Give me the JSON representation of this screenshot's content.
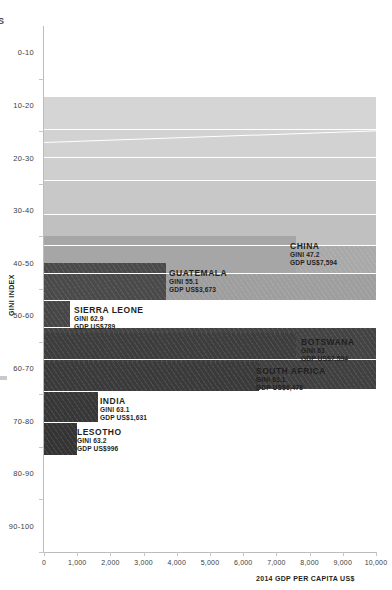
{
  "axes": {
    "y_title": "GINI INDEX",
    "x_title": "2014 GDP PER CAPITA US$",
    "y_ticks": [
      "0-10",
      "10-20",
      "20-30",
      "30-40",
      "40-50",
      "50-60",
      "60-70",
      "70-80",
      "80-90",
      "90-100"
    ],
    "x_ticks": [
      "0",
      "1,000",
      "2,000",
      "3,000",
      "4,000",
      "5,000",
      "6,000",
      "7,000",
      "8,000",
      "9,000",
      "10,000"
    ]
  },
  "corner_glyph": "S",
  "callouts": [
    {
      "name": "CHINA",
      "gini": "GINI 47.2",
      "gdp": "GDP US$7,594"
    },
    {
      "name": "GUATEMALA",
      "gini": "GINI 55.1",
      "gdp": "GDP US$3,673"
    },
    {
      "name": "SIERRA LEONE",
      "gini": "GINI 62.9",
      "gdp": "GDP US$789"
    },
    {
      "name": "BOTSWANA",
      "gini": "GINI 63",
      "gdp": "GDP US$7,594"
    },
    {
      "name": "SOUTH AFRICA",
      "gini": "GINI 63.1",
      "gdp": "GDP US$6,478"
    },
    {
      "name": "INDIA",
      "gini": "GINI 63.1",
      "gdp": "GDP US$1,631"
    },
    {
      "name": "LESOTHO",
      "gini": "GINI 63.2",
      "gdp": "GDP US$996"
    }
  ],
  "chart_data": {
    "type": "bar",
    "orientation": "horizontal",
    "title": "",
    "xlabel": "2014 GDP PER CAPITA US$",
    "ylabel": "GINI INDEX",
    "xlim": [
      0,
      10000
    ],
    "xticks": [
      0,
      1000,
      2000,
      3000,
      4000,
      5000,
      6000,
      7000,
      8000,
      9000,
      10000
    ],
    "y_categories": [
      "0-10",
      "10-20",
      "20-30",
      "30-40",
      "40-50",
      "50-60",
      "60-70",
      "70-80",
      "80-90",
      "90-100"
    ],
    "grid": false,
    "legend": "none",
    "note": "Stacked horizontal band chart: each country is one bar; bar length = 2014 GDP per capita US$, vertical position = Gini index band. Bars above 50 Gini are labelled; the light-gray bars in the 20-50 bands extend beyond the plotted 10,000 range (clipped at right edge).",
    "bars": [
      {
        "label": "",
        "gini": 22.0,
        "gdp": 10000,
        "clipped": true,
        "shade": "#d5d5d5"
      },
      {
        "label": "",
        "gini": 24.5,
        "gdp": 10000,
        "clipped": true,
        "shade": "#d2d2d2"
      },
      {
        "label": "",
        "gini": 27.0,
        "gdp": 10000,
        "clipped": true,
        "shade": "#cfcfcf"
      },
      {
        "label": "",
        "gini": 30.0,
        "gdp": 10000,
        "clipped": true,
        "shade": "#c8c8c8"
      },
      {
        "label": "",
        "gini": 34.0,
        "gdp": 10000,
        "clipped": true,
        "shade": "#c0c0c0"
      },
      {
        "label": "",
        "gini": 38.0,
        "gdp": 10000,
        "clipped": true,
        "shade": "#a9a9a9"
      },
      {
        "label": "",
        "gini": 43.0,
        "gdp": 10000,
        "clipped": true,
        "shade": "#9e9e9e"
      },
      {
        "label": "CHINA",
        "gini": 47.2,
        "gdp": 7594,
        "clipped": false,
        "shade": "#a6a6a6"
      },
      {
        "label": "GUATEMALA",
        "gini": 55.1,
        "gdp": 3673,
        "clipped": false,
        "shade": "#4a4a4a"
      },
      {
        "label": "SIERRA LEONE",
        "gini": 62.9,
        "gdp": 789,
        "clipped": false,
        "shade": "#464646"
      },
      {
        "label": "",
        "gini": 61.0,
        "gdp": 10000,
        "clipped": true,
        "shade": "#434343"
      },
      {
        "label": "",
        "gini": 62.0,
        "gdp": 10000,
        "clipped": true,
        "shade": "#404040"
      },
      {
        "label": "BOTSWANA",
        "gini": 63.0,
        "gdp": 7594,
        "clipped": false,
        "shade": "#3d3d3d"
      },
      {
        "label": "SOUTH AFRICA",
        "gini": 63.1,
        "gdp": 6478,
        "clipped": false,
        "shade": "#3a3a3a"
      },
      {
        "label": "INDIA",
        "gini": 63.1,
        "gdp": 1631,
        "clipped": false,
        "shade": "#373737"
      },
      {
        "label": "LESOTHO",
        "gini": 63.2,
        "gdp": 996,
        "clipped": false,
        "shade": "#343434"
      }
    ]
  }
}
